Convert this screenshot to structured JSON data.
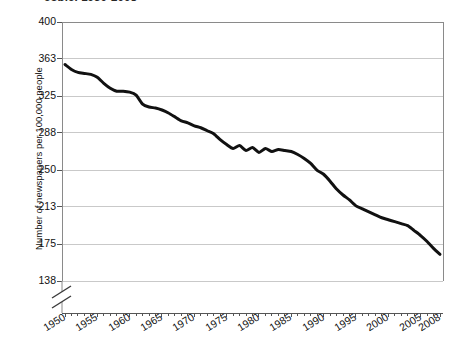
{
  "chart_title": "eople, 1950-2008",
  "y_axis_title": "Number of newspapers per 100,000 people",
  "axis_break": "axis-break-mark",
  "chart_data": {
    "type": "line",
    "title": "eople, 1950-2008",
    "xlabel": "",
    "ylabel": "Number of newspapers per 100,000 people",
    "xlim": [
      1950,
      2008
    ],
    "ylim": [
      138,
      400
    ],
    "y_axis_broken": true,
    "y_ticks": [
      138,
      175,
      213,
      250,
      288,
      325,
      363,
      400
    ],
    "y_tick_labels": [
      "138",
      "175",
      "213",
      "250",
      "288",
      "325",
      "363",
      "400"
    ],
    "x_ticks": [
      1950,
      1955,
      1960,
      1965,
      1970,
      1975,
      1980,
      1985,
      1990,
      1995,
      2000,
      2005,
      2008
    ],
    "x_tick_labels": [
      "1950",
      "1955",
      "1960",
      "1965",
      "1970",
      "1975",
      "1980",
      "1985",
      "1990",
      "1995",
      "2000",
      "2005",
      "2008"
    ],
    "x_minor_tick_interval": 1,
    "grid": "horizontal",
    "legend": "none",
    "line_color": "#111111",
    "line_width": 3,
    "x": [
      1950,
      1951,
      1952,
      1953,
      1954,
      1955,
      1956,
      1957,
      1958,
      1959,
      1960,
      1961,
      1962,
      1963,
      1964,
      1965,
      1966,
      1967,
      1968,
      1969,
      1970,
      1971,
      1972,
      1973,
      1974,
      1975,
      1976,
      1977,
      1978,
      1979,
      1980,
      1981,
      1982,
      1983,
      1984,
      1985,
      1986,
      1987,
      1988,
      1989,
      1990,
      1991,
      1992,
      1993,
      1994,
      1995,
      1996,
      1997,
      1998,
      1999,
      2000,
      2001,
      2002,
      2003,
      2004,
      2005,
      2006,
      2007,
      2008
    ],
    "values": [
      357,
      352,
      349,
      348,
      347,
      344,
      338,
      333,
      330,
      330,
      329,
      326,
      317,
      314,
      313,
      311,
      308,
      304,
      300,
      298,
      295,
      293,
      290,
      287,
      281,
      276,
      272,
      275,
      270,
      273,
      268,
      272,
      269,
      271,
      270,
      269,
      266,
      262,
      257,
      250,
      246,
      239,
      231,
      225,
      220,
      214,
      211,
      208,
      205,
      202,
      200,
      198,
      196,
      194,
      189,
      184,
      178,
      171,
      165
    ],
    "series": [
      {
        "name": "Number of newspapers per 100,000 people",
        "values": [
          357,
          352,
          349,
          348,
          347,
          344,
          338,
          333,
          330,
          330,
          329,
          326,
          317,
          314,
          313,
          311,
          308,
          304,
          300,
          298,
          295,
          293,
          290,
          287,
          281,
          276,
          272,
          275,
          270,
          273,
          268,
          272,
          269,
          271,
          270,
          269,
          266,
          262,
          257,
          250,
          246,
          239,
          231,
          225,
          220,
          214,
          211,
          208,
          205,
          202,
          200,
          198,
          196,
          194,
          189,
          184,
          178,
          171,
          165
        ]
      }
    ]
  }
}
